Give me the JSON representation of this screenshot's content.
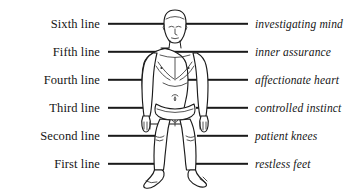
{
  "diagram": {
    "figure_name": "standing-human-figure",
    "line_color": "#1a1a1a",
    "figure_stroke_color": "#1b1b1b",
    "background": "#ffffff",
    "rows": [
      {
        "y": 24,
        "left": "Sixth line",
        "right": "investigating mind"
      },
      {
        "y": 52,
        "left": "Fifth line",
        "right": "inner assurance"
      },
      {
        "y": 80,
        "left": "Fourth line",
        "right": "affectionate heart"
      },
      {
        "y": 108,
        "left": "Third line",
        "right": "controlled instinct"
      },
      {
        "y": 136,
        "left": "Second line",
        "right": "patient knees"
      },
      {
        "y": 164,
        "left": "First line",
        "right": "restless feet"
      }
    ]
  }
}
